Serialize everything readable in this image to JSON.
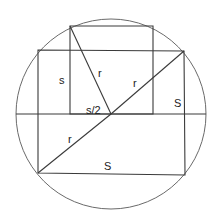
{
  "figure": {
    "type": "geometry",
    "circle": {
      "cx": 111,
      "cy": 114,
      "r": 95
    },
    "horizontal_diameter": {
      "x1": 16,
      "y1": 114,
      "x2": 206,
      "y2": 114
    },
    "large_rectangle": {
      "top_left": [
        38,
        50
      ],
      "top_right": [
        184,
        51
      ],
      "bottom_right": [
        185,
        175
      ],
      "bottom_left": [
        38,
        173
      ]
    },
    "small_square": {
      "top_left": [
        70,
        26
      ],
      "top_right": [
        153,
        26
      ],
      "bottom_right": [
        153,
        114
      ],
      "bottom_left": [
        70,
        114
      ]
    },
    "segments": [
      {
        "name": "diagonal-radius-upper",
        "from": [
          111,
          114
        ],
        "to": [
          184,
          51
        ]
      },
      {
        "name": "diagonal-radius-lower",
        "from": [
          111,
          114
        ],
        "to": [
          38,
          173
        ]
      },
      {
        "name": "radius-to-square-corner",
        "from": [
          111,
          114
        ],
        "to": [
          70,
          26
        ]
      }
    ],
    "labels": [
      {
        "id": "label-s",
        "text": "s",
        "x": 59,
        "y": 84
      },
      {
        "id": "label-r-square",
        "text": "r",
        "x": 98,
        "y": 77
      },
      {
        "id": "label-s-half",
        "text": "s/2",
        "x": 86,
        "y": 114
      },
      {
        "id": "label-r-upper",
        "text": "r",
        "x": 133,
        "y": 87
      },
      {
        "id": "label-S-right",
        "text": "S",
        "x": 174,
        "y": 107
      },
      {
        "id": "label-r-lower",
        "text": "r",
        "x": 68,
        "y": 143
      },
      {
        "id": "label-S-bottom",
        "text": "S",
        "x": 104,
        "y": 170
      }
    ],
    "colors": {
      "line": "#3a3a3a",
      "circle": "#6a6a6a",
      "text": "#222222",
      "background": "#ffffff"
    }
  }
}
